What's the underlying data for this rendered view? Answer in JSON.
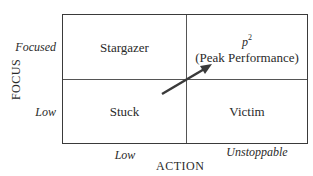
{
  "diagram": {
    "type": "2x2 matrix",
    "y_axis": {
      "title": "FOCUS",
      "ticks": [
        "Focused",
        "Low"
      ]
    },
    "x_axis": {
      "title": "ACTION",
      "ticks": [
        "Low",
        "Unstoppable"
      ]
    },
    "quadrants": {
      "top_left": "Stargazer",
      "top_right": {
        "symbol": "p",
        "superscript": "2",
        "label": "(Peak Performance)"
      },
      "bottom_left": "Stuck",
      "bottom_right": "Victim"
    },
    "arrow": {
      "from": "Stuck",
      "to": "Peak Performance",
      "color": "#3a3a3a"
    }
  }
}
